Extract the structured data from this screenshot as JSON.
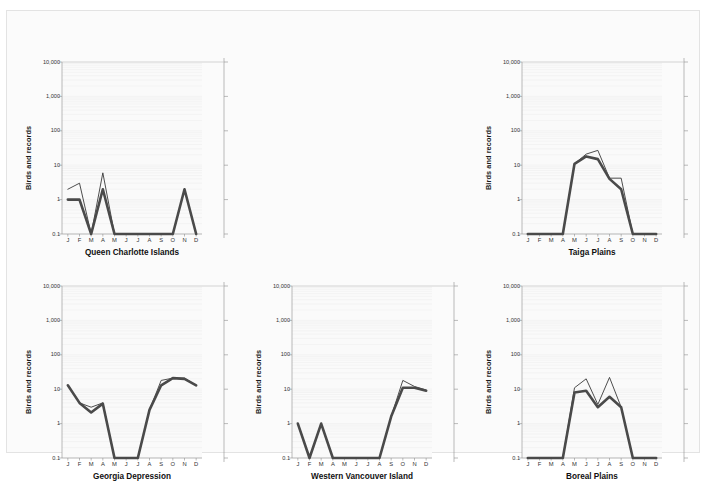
{
  "figure": {
    "background": "#fbfbfb",
    "panel_background": "#fafafa",
    "series_colors": {
      "thin": "#3a3a3a",
      "thick": "#4a4a4a"
    }
  },
  "axis": {
    "ylabel": "Birds and records",
    "yticks": [
      "10,000",
      "1,000",
      "100",
      "10",
      "1",
      "0.1"
    ],
    "ytick_values": [
      10000,
      1000,
      100,
      10,
      1,
      0.1
    ],
    "ylim": [
      0.1,
      10000
    ],
    "yscale": "log",
    "xticks": [
      "J",
      "F",
      "M",
      "A",
      "M",
      "J",
      "J",
      "A",
      "S",
      "O",
      "N",
      "D"
    ]
  },
  "chart_data": [
    {
      "type": "line",
      "title": "Queen Charlotte Islands",
      "xlabel": "",
      "ylabel": "Birds and records",
      "categories": [
        "J",
        "F",
        "M",
        "A",
        "M",
        "J",
        "J",
        "A",
        "S",
        "O",
        "N",
        "D"
      ],
      "ylim": [
        0.1,
        10000
      ],
      "yscale": "log",
      "grid": true,
      "legend": "none",
      "series": [
        {
          "name": "records",
          "style": "thin",
          "values": [
            2,
            3,
            0.1,
            6,
            0.1,
            0.1,
            0.1,
            0.1,
            0.1,
            0.1,
            2,
            0.1
          ]
        },
        {
          "name": "birds",
          "style": "thick",
          "values": [
            1,
            1,
            0.1,
            2,
            0.1,
            0.1,
            0.1,
            0.1,
            0.1,
            0.1,
            2,
            0.1
          ]
        }
      ]
    },
    {
      "type": "line",
      "title": "Taiga Plains",
      "xlabel": "",
      "ylabel": "Birds and records",
      "categories": [
        "J",
        "F",
        "M",
        "A",
        "M",
        "J",
        "J",
        "A",
        "S",
        "O",
        "N",
        "D"
      ],
      "ylim": [
        0.1,
        10000
      ],
      "yscale": "log",
      "grid": true,
      "legend": "none",
      "series": [
        {
          "name": "records",
          "style": "thin",
          "values": [
            0.1,
            0.1,
            0.1,
            0.1,
            11,
            21,
            27,
            4.2,
            4.2,
            0.1,
            0.1,
            0.1
          ]
        },
        {
          "name": "birds",
          "style": "thick",
          "values": [
            0.1,
            0.1,
            0.1,
            0.1,
            11,
            18,
            15,
            4,
            2,
            0.1,
            0.1,
            0.1
          ]
        }
      ]
    },
    {
      "type": "line",
      "title": "Georgia Depression",
      "xlabel": "",
      "ylabel": "Birds and records",
      "categories": [
        "J",
        "F",
        "M",
        "A",
        "M",
        "J",
        "J",
        "A",
        "S",
        "O",
        "N",
        "D"
      ],
      "ylim": [
        0.1,
        10000
      ],
      "yscale": "log",
      "grid": true,
      "legend": "none",
      "series": [
        {
          "name": "records",
          "style": "thin",
          "values": [
            13,
            4,
            3,
            4,
            0.1,
            0.1,
            0.1,
            2.5,
            18,
            21,
            21,
            13
          ]
        },
        {
          "name": "birds",
          "style": "thick",
          "values": [
            13,
            4,
            2.1,
            3.8,
            0.1,
            0.1,
            0.1,
            2.5,
            13,
            21,
            20,
            13
          ]
        }
      ]
    },
    {
      "type": "line",
      "title": "Western Vancouver Island",
      "xlabel": "",
      "ylabel": "Birds and records",
      "categories": [
        "J",
        "F",
        "M",
        "A",
        "M",
        "J",
        "J",
        "A",
        "S",
        "O",
        "N",
        "D"
      ],
      "ylim": [
        0.1,
        10000
      ],
      "yscale": "log",
      "grid": true,
      "legend": "none",
      "series": [
        {
          "name": "records",
          "style": "thin",
          "values": [
            1,
            0.1,
            1,
            0.1,
            0.1,
            0.1,
            0.1,
            0.1,
            1.6,
            18,
            12,
            9.5
          ]
        },
        {
          "name": "birds",
          "style": "thick",
          "values": [
            1,
            0.1,
            1,
            0.1,
            0.1,
            0.1,
            0.1,
            0.1,
            1.6,
            11,
            11,
            9
          ]
        }
      ]
    },
    {
      "type": "line",
      "title": "Boreal Plains",
      "xlabel": "",
      "ylabel": "Birds and records",
      "categories": [
        "J",
        "F",
        "M",
        "A",
        "M",
        "J",
        "J",
        "A",
        "S",
        "O",
        "N",
        "D"
      ],
      "ylim": [
        0.1,
        10000
      ],
      "yscale": "log",
      "grid": true,
      "legend": "none",
      "series": [
        {
          "name": "records",
          "style": "thin",
          "values": [
            0.1,
            0.1,
            0.1,
            0.1,
            11,
            20,
            3.6,
            22,
            3,
            0.1,
            0.1,
            0.1
          ]
        },
        {
          "name": "birds",
          "style": "thick",
          "values": [
            0.1,
            0.1,
            0.1,
            0.1,
            8,
            9,
            3,
            6,
            3,
            0.1,
            0.1,
            0.1
          ]
        }
      ]
    }
  ],
  "panels": [
    {
      "key": 0,
      "left": 18,
      "top": 18,
      "plot_w": 140,
      "plot_h": 172,
      "label_x": 60,
      "show_right_axis": true,
      "right_axis_x": 180
    },
    {
      "key": 1,
      "left": 478,
      "top": 18,
      "plot_w": 140,
      "plot_h": 172,
      "label_x": 66,
      "show_right_axis": true,
      "right_axis_x": 184
    },
    {
      "key": 2,
      "left": 18,
      "top": 242,
      "plot_w": 140,
      "plot_h": 172,
      "label_x": 62,
      "show_right_axis": true,
      "right_axis_x": 180
    },
    {
      "key": 3,
      "left": 248,
      "top": 242,
      "plot_w": 140,
      "plot_h": 172,
      "label_x": 48,
      "show_right_axis": true,
      "right_axis_x": 180
    },
    {
      "key": 4,
      "left": 478,
      "top": 242,
      "plot_w": 140,
      "plot_h": 172,
      "label_x": 66,
      "show_right_axis": true,
      "right_axis_x": 184
    }
  ]
}
